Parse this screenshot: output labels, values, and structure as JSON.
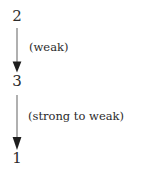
{
  "diagram": {
    "type": "vertical-flow",
    "background_color": "#ffffff",
    "ink_color": "#2b2b2b",
    "nodes": [
      {
        "id": "node-2",
        "label": "2",
        "position": "top"
      },
      {
        "id": "node-3",
        "label": "3",
        "position": "middle"
      },
      {
        "id": "node-1",
        "label": "1",
        "position": "bottom"
      }
    ],
    "edges": [
      {
        "id": "edge-2-to-3",
        "from": "2",
        "to": "3",
        "direction": "down",
        "arrowhead": "filled-triangle",
        "label": "(weak)"
      },
      {
        "id": "edge-3-to-1",
        "from": "3",
        "to": "1",
        "direction": "down",
        "arrowhead": "filled-triangle",
        "label": "(strong to weak)"
      }
    ]
  }
}
